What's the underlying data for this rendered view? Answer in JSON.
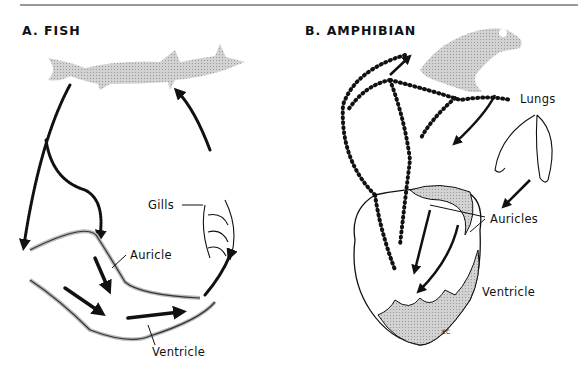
{
  "figure": {
    "panel_a": {
      "title": "A. FISH",
      "labels": {
        "gills": "Gills",
        "auricle": "Auricle",
        "ventricle": "Ventricle"
      }
    },
    "panel_b": {
      "title": "B. AMPHIBIAN",
      "labels": {
        "lungs": "Lungs",
        "auricles": "Auricles",
        "ventricle": "Ventricle"
      }
    },
    "signature": "EC",
    "colors": {
      "ink": "#111111",
      "body_gray": "#c8c8c8",
      "wall_gray": "#bdbdbd"
    }
  }
}
